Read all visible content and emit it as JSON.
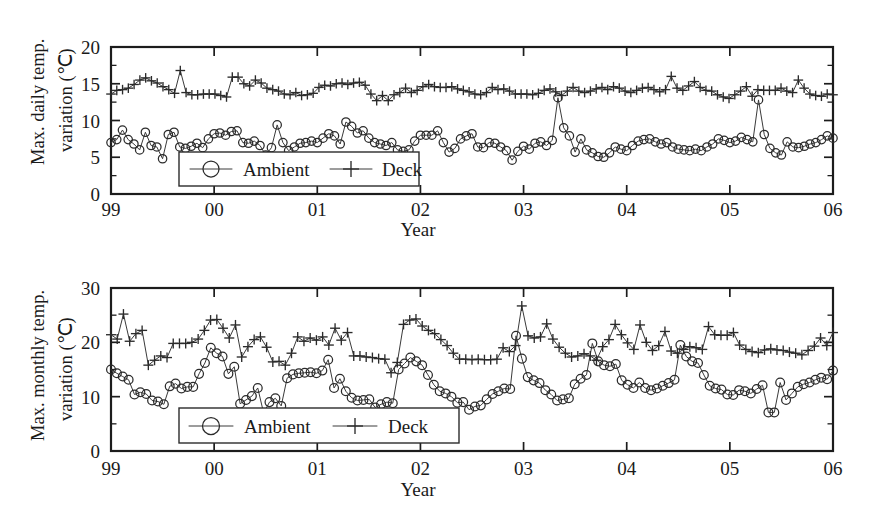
{
  "figure": {
    "background": "#ffffff",
    "ink_color": "#1a1a1a",
    "panel_count": 2
  },
  "chart_data": [
    {
      "id": "max-daily-temp-variation",
      "type": "line",
      "title": "",
      "xlabel": "Year",
      "ylabel": "Max. daily temp. variation (°C)",
      "ylabel_line1": "Max. daily temp.",
      "ylabel_line2": "variation (℃)",
      "xlim": [
        1999,
        2006
      ],
      "ylim": [
        0,
        20
      ],
      "yticks": [
        0,
        5,
        10,
        15,
        20
      ],
      "ytick_labels": [
        "0",
        "5",
        "10",
        "15",
        "20"
      ],
      "y_minor_count": 1,
      "xticks": [
        1999,
        2000,
        2001,
        2002,
        2003,
        2004,
        2005,
        2006
      ],
      "xtick_labels": [
        "99",
        "00",
        "01",
        "02",
        "03",
        "04",
        "05",
        "06"
      ],
      "x_minor_count": 0,
      "grid": false,
      "legend_position": "lower-left-inside",
      "series": [
        {
          "name": "Ambient",
          "marker": "circle",
          "values": [
            7.0,
            7.4,
            8.7,
            7.4,
            6.8,
            6.0,
            8.4,
            6.6,
            6.4,
            4.8,
            8.1,
            8.4,
            6.4,
            6.2,
            6.5,
            6.9,
            6.3,
            7.5,
            8.2,
            8.3,
            8.0,
            8.5,
            8.6,
            7.0,
            6.9,
            7.2,
            6.6,
            5.3,
            6.3,
            9.4,
            7.0,
            5.9,
            6.4,
            6.9,
            7.0,
            7.2,
            7.0,
            7.6,
            8.2,
            7.9,
            6.8,
            9.8,
            9.2,
            8.3,
            8.6,
            7.6,
            7.0,
            6.8,
            6.6,
            7.0,
            6.0,
            5.8,
            6.0,
            7.2,
            8.0,
            8.0,
            8.0,
            8.6,
            7.0,
            5.7,
            6.2,
            7.5,
            7.9,
            8.2,
            6.4,
            6.3,
            7.0,
            6.9,
            6.4,
            5.9,
            4.6,
            5.8,
            6.5,
            6.1,
            6.9,
            7.1,
            6.6,
            7.3,
            13.1,
            9.0,
            7.9,
            5.7,
            7.5,
            6.0,
            5.6,
            5.1,
            5.0,
            5.6,
            6.4,
            6.1,
            5.9,
            6.6,
            7.2,
            7.4,
            7.5,
            7.1,
            6.8,
            7.0,
            6.4,
            6.1,
            6.0,
            5.9,
            6.1,
            5.9,
            6.4,
            6.8,
            7.5,
            7.3,
            7.0,
            7.2,
            7.7,
            7.4,
            7.1,
            12.8,
            8.1,
            6.2,
            5.6,
            5.3,
            7.1,
            6.4,
            6.3,
            6.5,
            6.8,
            7.0,
            7.4,
            7.9,
            7.6
          ],
          "note": "Monthly max daily temperature variation, ambient"
        },
        {
          "name": "Deck",
          "marker": "plus",
          "values": [
            13.6,
            14.1,
            14.2,
            14.4,
            14.9,
            15.5,
            15.8,
            15.4,
            15.1,
            14.6,
            14.2,
            13.7,
            16.8,
            13.8,
            13.5,
            13.5,
            13.6,
            13.6,
            13.6,
            13.4,
            13.2,
            15.9,
            15.9,
            15.0,
            14.7,
            15.5,
            15.1,
            14.4,
            14.2,
            14.0,
            13.6,
            13.5,
            13.8,
            13.4,
            13.5,
            13.7,
            14.5,
            14.8,
            14.7,
            15.0,
            15.1,
            14.9,
            15.1,
            15.2,
            14.8,
            13.6,
            12.7,
            13.4,
            12.7,
            13.5,
            13.8,
            14.4,
            13.8,
            14.1,
            14.6,
            14.9,
            14.6,
            14.5,
            14.5,
            14.6,
            14.3,
            14.1,
            13.9,
            13.6,
            13.5,
            13.8,
            14.5,
            14.2,
            14.3,
            14.0,
            13.6,
            13.6,
            13.6,
            13.5,
            13.7,
            14.1,
            14.3,
            13.9,
            13.4,
            14.0,
            14.5,
            14.0,
            13.8,
            14.0,
            14.3,
            14.5,
            14.2,
            14.6,
            14.4,
            14.0,
            13.8,
            14.1,
            14.4,
            14.5,
            14.2,
            13.9,
            14.2,
            16.0,
            14.4,
            14.1,
            14.7,
            15.3,
            14.5,
            14.1,
            14.0,
            13.5,
            13.2,
            13.0,
            13.5,
            14.0,
            14.6,
            13.3,
            14.2,
            14.1,
            14.1,
            14.1,
            14.4,
            14.0,
            13.8,
            15.5,
            14.4,
            13.6,
            13.4,
            13.3,
            13.6,
            13.5
          ],
          "note": "Monthly max daily temperature variation, bridge deck"
        }
      ]
    },
    {
      "id": "max-monthly-temp-variation",
      "type": "line",
      "title": "",
      "xlabel": "Year",
      "ylabel": "Max. monthly temp. variation (°C)",
      "ylabel_line1": "Max. monthly temp.",
      "ylabel_line2": "variation (℃)",
      "xlim": [
        1999,
        2006
      ],
      "ylim": [
        0,
        30
      ],
      "yticks": [
        0,
        10,
        20,
        30
      ],
      "ytick_labels": [
        "0",
        "10",
        "20",
        "30"
      ],
      "y_minor_count": 1,
      "xticks": [
        1999,
        2000,
        2001,
        2002,
        2003,
        2004,
        2005,
        2006
      ],
      "xtick_labels": [
        "99",
        "00",
        "01",
        "02",
        "03",
        "04",
        "05",
        "06"
      ],
      "x_minor_count": 0,
      "grid": false,
      "legend_position": "lower-left-inside",
      "series": [
        {
          "name": "Ambient",
          "marker": "circle",
          "values": [
            15.0,
            14.3,
            13.7,
            13.1,
            10.4,
            10.8,
            10.5,
            9.3,
            9.1,
            8.6,
            11.9,
            12.4,
            11.5,
            11.8,
            11.8,
            14.2,
            16.2,
            19.0,
            18.0,
            17.4,
            14.2,
            15.5,
            8.7,
            9.4,
            10.1,
            11.6,
            7.0,
            9.0,
            9.7,
            8.3,
            13.4,
            14.1,
            14.3,
            14.4,
            14.5,
            14.3,
            14.8,
            16.8,
            11.6,
            13.3,
            11.0,
            9.8,
            9.3,
            9.4,
            9.5,
            8.0,
            8.6,
            9.0,
            8.8,
            15.0,
            16.1,
            17.2,
            16.5,
            15.8,
            14.0,
            12.2,
            11.0,
            10.6,
            10.0,
            8.9,
            9.0,
            7.6,
            8.2,
            8.4,
            9.5,
            10.5,
            11.0,
            11.5,
            11.4,
            21.2,
            17.0,
            13.6,
            13.0,
            12.5,
            11.2,
            10.4,
            9.3,
            9.5,
            9.7,
            12.3,
            13.3,
            14.0,
            19.8,
            16.5,
            15.8,
            15.6,
            16.0,
            13.0,
            12.2,
            11.6,
            12.6,
            11.6,
            11.2,
            11.5,
            12.0,
            12.5,
            13.1,
            19.5,
            17.4,
            16.5,
            16.2,
            14.0,
            12.0,
            11.5,
            11.3,
            10.4,
            10.3,
            11.2,
            11.0,
            10.6,
            11.4,
            12.1,
            7.1,
            7.1,
            12.6,
            9.4,
            10.6,
            11.8,
            12.3,
            12.6,
            13.1,
            13.5,
            13.2,
            14.8
          ],
          "note": "Monthly max monthly temperature variation, ambient"
        },
        {
          "name": "Deck",
          "marker": "plus",
          "values": [
            21.4,
            20.6,
            25.2,
            20.2,
            21.6,
            22.2,
            15.8,
            16.7,
            17.5,
            17.2,
            19.8,
            19.8,
            19.8,
            20.0,
            20.6,
            22.2,
            24.1,
            24.2,
            22.6,
            20.8,
            23.2,
            17.3,
            19.2,
            20.5,
            21.0,
            19.1,
            16.4,
            16.5,
            15.8,
            18.0,
            21.0,
            20.2,
            20.8,
            20.4,
            21.0,
            19.5,
            22.6,
            20.4,
            21.8,
            17.5,
            17.5,
            17.3,
            17.2,
            17.0,
            16.9,
            14.4,
            16.3,
            23.3,
            24.1,
            24.3,
            23.0,
            22.2,
            21.6,
            20.5,
            19.4,
            18.0,
            16.9,
            16.9,
            16.8,
            16.9,
            16.8,
            16.8,
            16.9,
            19.0,
            18.3,
            19.4,
            26.7,
            21.2,
            20.8,
            21.0,
            23.4,
            20.6,
            19.1,
            18.0,
            17.3,
            17.5,
            17.9,
            17.5,
            16.7,
            19.2,
            20.5,
            23.3,
            21.4,
            19.9,
            18.7,
            23.2,
            20.0,
            18.5,
            19.4,
            22.0,
            18.4,
            18.0,
            18.7,
            19.2,
            19.0,
            18.7,
            22.9,
            21.4,
            21.3,
            21.3,
            21.8,
            19.5,
            18.7,
            18.3,
            18.1,
            18.6,
            18.8,
            18.6,
            18.5,
            18.2,
            18.0,
            17.7,
            18.5,
            19.3,
            20.8,
            19.4,
            21.8
          ],
          "note": "Monthly max monthly temperature variation, bridge deck"
        }
      ]
    }
  ],
  "legend": {
    "ambient_label": "Ambient",
    "deck_label": "Deck",
    "ambient_marker": "circle-marker-icon",
    "deck_marker": "plus-marker-icon"
  },
  "axis": {
    "x_title": "Year"
  }
}
